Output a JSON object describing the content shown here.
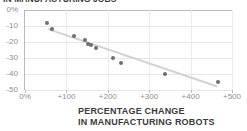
{
  "chart_data": {
    "type": "scatter",
    "title": "IN MANUFACTURING JOBS",
    "xlabel_line1": "PERCENTAGE CHANGE",
    "xlabel_line2": "IN MANUFACTURING ROBOTS",
    "ylabel": "",
    "xlim": [
      0,
      500
    ],
    "ylim": [
      -50,
      0
    ],
    "grid": true,
    "legend": null,
    "x_ticks": [
      0,
      100,
      200,
      300,
      400,
      500
    ],
    "x_tick_labels": [
      "0%",
      "+100",
      "+200",
      "+300",
      "+400",
      "+500"
    ],
    "y_ticks": [
      0,
      -10,
      -20,
      -30,
      -40,
      -50
    ],
    "y_tick_labels": [
      "0%",
      "-10",
      "-20",
      "-30",
      "-40",
      "-50"
    ],
    "points": [
      {
        "x": 53,
        "y": -8
      },
      {
        "x": 65,
        "y": -12
      },
      {
        "x": 118,
        "y": -16
      },
      {
        "x": 145,
        "y": -19
      },
      {
        "x": 152,
        "y": -21
      },
      {
        "x": 160,
        "y": -22
      },
      {
        "x": 172,
        "y": -24
      },
      {
        "x": 212,
        "y": -30
      },
      {
        "x": 232,
        "y": -33
      },
      {
        "x": 338,
        "y": -40
      },
      {
        "x": 466,
        "y": -45
      }
    ],
    "trendline": {
      "x0": 55,
      "y0": -11,
      "x1": 465,
      "y1": -47
    },
    "colors": {
      "point": "#6d6d6d",
      "trendline": "#d2d2d2",
      "grid": "#e6e6e6",
      "axis": "#b9b9b9",
      "tick_text": "#8d8d8d",
      "title_text": "#3b3b3b",
      "background": "#ffffff"
    }
  }
}
